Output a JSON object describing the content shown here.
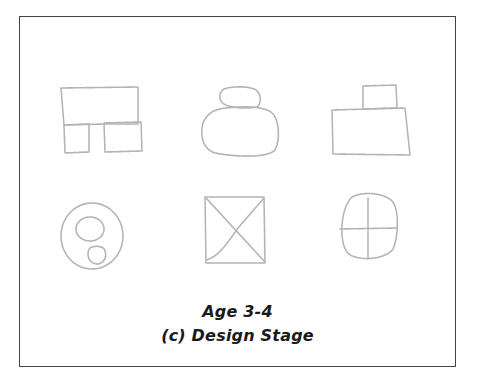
{
  "figure": {
    "caption_line1": "Age 3-4",
    "caption_line2": "(c) Design Stage",
    "colors": {
      "frame": "#444444",
      "sketch_stroke": "#b4b4b4",
      "caption_text": "#1a1a1a",
      "background": "#ffffff"
    },
    "drawings": [
      {
        "row": 1,
        "col": 1,
        "name": "rectangle-over-two-boxes"
      },
      {
        "row": 1,
        "col": 2,
        "name": "small-oval-on-large-oval"
      },
      {
        "row": 1,
        "col": 3,
        "name": "small-box-on-large-rectangle"
      },
      {
        "row": 2,
        "col": 1,
        "name": "circle-with-two-inner-circles"
      },
      {
        "row": 2,
        "col": 2,
        "name": "square-with-x"
      },
      {
        "row": 2,
        "col": 3,
        "name": "circle-with-cross"
      }
    ]
  }
}
